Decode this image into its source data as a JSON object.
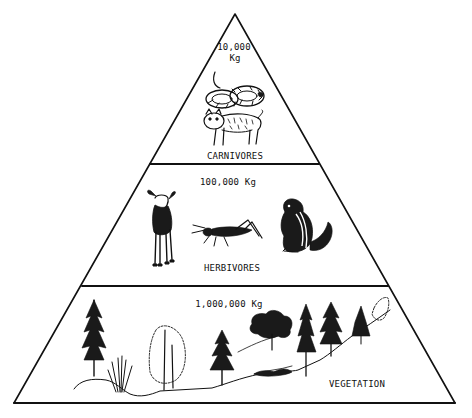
{
  "diagram": {
    "type": "ecological-pyramid",
    "colors": {
      "ink": "#111111",
      "background": "#ffffff"
    },
    "levels": [
      {
        "id": "carnivores",
        "mass_line1": "10,000",
        "mass_line2": "Kg",
        "label": "CARNIVORES",
        "illustrations": [
          "snake-icon",
          "bobcat-icon"
        ]
      },
      {
        "id": "herbivores",
        "mass": "100,000 Kg",
        "label": "HERBIVORES",
        "illustrations": [
          "deer-icon",
          "grasshopper-icon",
          "chipmunk-icon"
        ]
      },
      {
        "id": "vegetation",
        "mass": "1,000,000 Kg",
        "label": "VEGETATION",
        "illustrations": [
          "conifer-trees-icon",
          "shrub-icon",
          "deciduous-tree-icon",
          "hillside-icon"
        ]
      }
    ]
  }
}
